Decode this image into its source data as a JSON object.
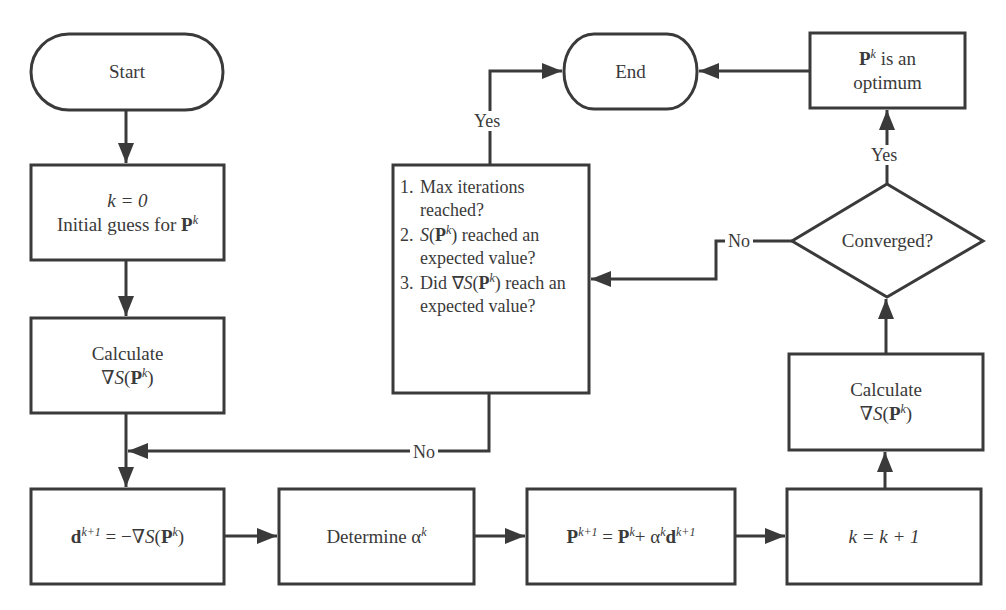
{
  "diagram": {
    "type": "flowchart",
    "colors": {
      "stroke": "#3a3a3a",
      "fill": "#ffffff",
      "text": "#3a3a3a"
    },
    "nodes": {
      "start": {
        "shape": "terminal",
        "label": "Start"
      },
      "init": {
        "shape": "process",
        "line1": "k = 0",
        "line2_text": "Initial guess for ",
        "line2_sym": "P",
        "line2_sup": "k"
      },
      "calc_left": {
        "shape": "process",
        "line1": "Calculate",
        "line2": "∇S(P^k)"
      },
      "direction": {
        "shape": "process",
        "label": "d^(k+1) = −∇S(P^k)"
      },
      "step": {
        "shape": "process",
        "text": "Determine α",
        "sup": "k"
      },
      "update": {
        "shape": "process",
        "label": "P^(k+1) = P^k + α^k d^(k+1)"
      },
      "increment": {
        "shape": "process",
        "label": "k = k + 1"
      },
      "calc_right": {
        "shape": "process",
        "line1": "Calculate",
        "line2": "∇S(P^k)"
      },
      "converged": {
        "shape": "decision",
        "label": "Converged?"
      },
      "optimum": {
        "shape": "process",
        "line1_sym": "P",
        "line1_sup": "k",
        "line1_text": " is an",
        "line2": "optimum"
      },
      "end": {
        "shape": "terminal",
        "label": "End"
      },
      "stop_check": {
        "shape": "process",
        "items": [
          {
            "num": "1.",
            "text": "Max iterations reached?"
          },
          {
            "num": "2.",
            "text": "S(P^k) reached an expected value?"
          },
          {
            "num": "3.",
            "text": "Did ∇S(P^k) reach an expected value?"
          }
        ]
      }
    },
    "edges": [
      {
        "from": "start",
        "to": "init",
        "label": ""
      },
      {
        "from": "init",
        "to": "calc_left",
        "label": ""
      },
      {
        "from": "calc_left",
        "to": "direction",
        "label": ""
      },
      {
        "from": "direction",
        "to": "step",
        "label": ""
      },
      {
        "from": "step",
        "to": "update",
        "label": ""
      },
      {
        "from": "update",
        "to": "increment",
        "label": ""
      },
      {
        "from": "increment",
        "to": "calc_right",
        "label": ""
      },
      {
        "from": "calc_right",
        "to": "converged",
        "label": ""
      },
      {
        "from": "converged",
        "to": "optimum",
        "label": "Yes"
      },
      {
        "from": "optimum",
        "to": "end",
        "label": ""
      },
      {
        "from": "converged",
        "to": "stop_check",
        "label": "No"
      },
      {
        "from": "stop_check",
        "to": "end",
        "label": "Yes"
      },
      {
        "from": "stop_check",
        "to": "direction",
        "label": "No"
      }
    ],
    "edge_labels": {
      "converged_yes": "Yes",
      "converged_no": "No",
      "stop_yes": "Yes",
      "stop_no": "No"
    }
  }
}
